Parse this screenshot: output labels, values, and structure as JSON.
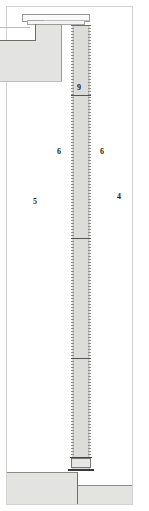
{
  "drawing": {
    "type": "architectural-section",
    "description": "Vertical section detail: slender column between upper slab/beam and stepped foundation",
    "background_color": "#ffffff",
    "frame_color": "#d2d2d2",
    "fill_color": "#e3e3e1",
    "column_fill_color": "#dcdcda",
    "line_color": "#8d8d8d"
  },
  "labels": [
    {
      "id": "label-9",
      "text": "9",
      "x": 77,
      "y": 84
    },
    {
      "id": "label-6-left",
      "text": "6",
      "x": 57,
      "y": 148
    },
    {
      "id": "label-6-right",
      "text": "6",
      "x": 100,
      "y": 148
    },
    {
      "id": "label-5",
      "text": "5",
      "x": 33,
      "y": 198
    },
    {
      "id": "label-4",
      "text": "4",
      "x": 117,
      "y": 193
    }
  ],
  "elements": {
    "top_beam": "beam",
    "top_left_mass": "wall-slab",
    "column": "column",
    "base_plate": "base-plate",
    "foundation_left": "foundation-upper-step",
    "foundation_right": "foundation-lower-step"
  },
  "column_joints": [
    95,
    238,
    358
  ]
}
